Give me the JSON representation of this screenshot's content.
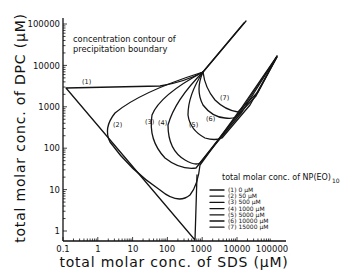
{
  "chart_data": {
    "type": "line",
    "title": "",
    "annotation": [
      "concentration contour of",
      "precipitation boundary"
    ],
    "xlabel": "total molar conc. of SDS (μM)",
    "ylabel": "total molar conc. of DPC (μM)",
    "xscale": "log",
    "yscale": "log",
    "xlim": [
      0.1,
      100000
    ],
    "ylim": [
      1,
      100000
    ],
    "x_ticks": [
      "0.1",
      "1",
      "10",
      "100",
      "1000",
      "10000",
      "100000"
    ],
    "y_ticks": [
      "1",
      "10",
      "100",
      "1000",
      "10000",
      "100000"
    ],
    "grid": false,
    "legend": {
      "title": "total molar conc. of NP(EO)",
      "title_subscript": "10",
      "position": "lower right",
      "entries": [
        {
          "id": "(1)",
          "value": "0",
          "unit": "μM"
        },
        {
          "id": "(2)",
          "value": "50",
          "unit": "μM"
        },
        {
          "id": "(3)",
          "value": "500",
          "unit": "μM"
        },
        {
          "id": "(4)",
          "value": "1000",
          "unit": "μM"
        },
        {
          "id": "(5)",
          "value": "5000",
          "unit": "μM"
        },
        {
          "id": "(6)",
          "value": "10000",
          "unit": "μM"
        },
        {
          "id": "(7)",
          "value": "15000",
          "unit": "μM"
        }
      ]
    },
    "series": [
      {
        "name": "(1) 0 μM",
        "points": [
          [
            0.1,
            3000
          ],
          [
            10,
            3000
          ],
          [
            300,
            3500
          ],
          [
            1000,
            5000
          ],
          [
            10000,
            100000
          ],
          [
            1000,
            5000
          ],
          [
            600,
            1
          ],
          [
            0.1,
            3000
          ]
        ]
      },
      {
        "name": "(2) 50 μM",
        "points": [
          [
            1000,
            5000
          ],
          [
            20,
            1500
          ],
          [
            4,
            600
          ],
          [
            5,
            150
          ],
          [
            40,
            20
          ],
          [
            150,
            6
          ],
          [
            500,
            8
          ],
          [
            800,
            50
          ],
          [
            10000,
            10000
          ]
        ]
      },
      {
        "name": "(3) 500 μM",
        "points": [
          [
            1000,
            5000
          ],
          [
            150,
            1000
          ],
          [
            40,
            200
          ],
          [
            100,
            40
          ],
          [
            400,
            20
          ],
          [
            800,
            50
          ],
          [
            10000,
            12000
          ]
        ]
      },
      {
        "name": "(4) 1000 μM",
        "points": [
          [
            1000,
            5000
          ],
          [
            250,
            1000
          ],
          [
            100,
            200
          ],
          [
            200,
            60
          ],
          [
            500,
            40
          ],
          [
            900,
            60
          ],
          [
            12000,
            14000
          ]
        ]
      },
      {
        "name": "(5) 5000 μM",
        "points": [
          [
            1000,
            5000
          ],
          [
            600,
            1000
          ],
          [
            700,
            200
          ],
          [
            1500,
            100
          ],
          [
            3000,
            130
          ],
          [
            20000,
            15000
          ]
        ]
      },
      {
        "name": "(6) 10000 μM",
        "points": [
          [
            1000,
            5000
          ],
          [
            800,
            1500
          ],
          [
            1500,
            500
          ],
          [
            3000,
            300
          ],
          [
            5000,
            350
          ],
          [
            25000,
            16000
          ]
        ]
      },
      {
        "name": "(7) 15000 μM",
        "points": [
          [
            1000,
            5000
          ],
          [
            1200,
            2000
          ],
          [
            3000,
            700
          ],
          [
            7000,
            600
          ],
          [
            30000,
            17000
          ]
        ]
      }
    ],
    "curve_labels": [
      "(1)",
      "(2)",
      "(3)",
      "(4)",
      "(5)",
      "(6)",
      "(7)"
    ]
  }
}
